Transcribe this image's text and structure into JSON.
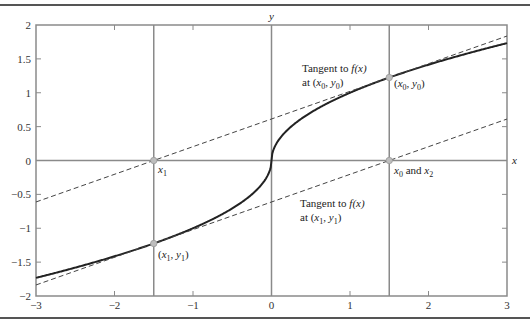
{
  "chart_data": {
    "type": "line",
    "title": "",
    "xlabel": "x",
    "ylabel": "y",
    "xlim": [
      -3,
      3
    ],
    "ylim": [
      -2,
      2
    ],
    "grid": false,
    "x_ticks": [
      -3,
      -2,
      -1,
      0,
      1,
      2,
      3
    ],
    "x_tick_labels": [
      "−3",
      "−2",
      "−1",
      "0",
      "1",
      "2",
      "3"
    ],
    "y_ticks": [
      -2,
      -1.5,
      -1,
      -0.5,
      0,
      0.5,
      1,
      1.5,
      2
    ],
    "y_tick_labels": [
      "−2",
      "−1.5",
      "−1",
      "−0.5",
      "0",
      "0.5",
      "1",
      "1.5",
      "2"
    ],
    "series": [
      {
        "name": "f(x)",
        "function": "sign(x)*sqrt(|x|)",
        "style": "solid",
        "color": "#222222",
        "x": [
          -3,
          -2.5,
          -2,
          -1.5,
          -1,
          -0.5,
          -0.1,
          0,
          0.1,
          0.5,
          1,
          1.5,
          2,
          2.5,
          3
        ],
        "y": [
          -1.732,
          -1.581,
          -1.414,
          -1.225,
          -1,
          -0.707,
          -0.316,
          0,
          0.316,
          0.707,
          1,
          1.225,
          1.414,
          1.581,
          1.732
        ]
      },
      {
        "name": "Tangent to f(x) at (x0, y0)",
        "style": "dashed",
        "color": "#444444",
        "x": [
          -3,
          3
        ],
        "y": [
          -0.612,
          1.837
        ]
      },
      {
        "name": "Tangent to f(x) at (x1, y1)",
        "style": "dashed",
        "color": "#444444",
        "x": [
          -3,
          3
        ],
        "y": [
          -1.837,
          0.612
        ]
      }
    ],
    "vertical_lines": [
      -1.5,
      1.5
    ],
    "points": [
      {
        "name": "x0-y0",
        "x": 1.5,
        "y": 1.225
      },
      {
        "name": "x1-y1",
        "x": -1.5,
        "y": -1.225
      },
      {
        "name": "x1",
        "x": -1.5,
        "y": 0
      },
      {
        "name": "x0-x2",
        "x": 1.5,
        "y": 0
      }
    ],
    "annotations": {
      "tangent0_line1": "Tangent to ",
      "tangent0_fx": "f(x)",
      "tangent0_line2": "at (x0, y0)",
      "point0": "(x0, y0)",
      "x1": "x1",
      "x0x2": "x0 and x2",
      "tangent1_line1": "Tangent to ",
      "tangent1_fx": "f(x)",
      "tangent1_line2": "at (x1, y1)",
      "point1": "(x1, y1)"
    },
    "colors": {
      "frame": "#8a8a8a",
      "curve": "#222222",
      "dashed": "#444444",
      "marker": "#bdbdbd",
      "rule": "#555555"
    }
  }
}
